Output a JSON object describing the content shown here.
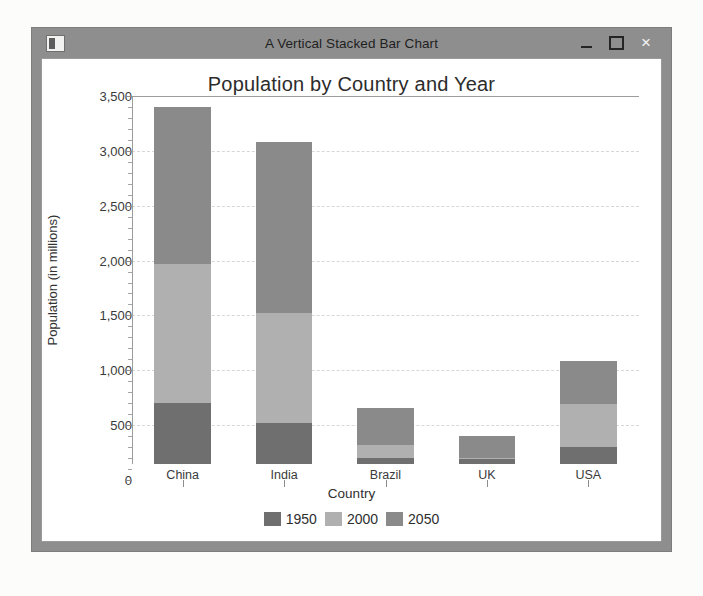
{
  "window": {
    "title": "A Vertical Stacked Bar Chart",
    "icon": "app-window-icon",
    "controls": {
      "minimize": "minimize-button",
      "maximize": "maximize-button",
      "close": "×"
    },
    "frame_color": "#8e8e8e",
    "client_color": "#ffffff"
  },
  "chart_data": {
    "type": "bar",
    "stacked": true,
    "orientation": "vertical",
    "title": "Population by Country and Year",
    "xlabel": "Country",
    "ylabel": "Population (in millions)",
    "categories": [
      "China",
      "India",
      "Brazil",
      "UK",
      "USA"
    ],
    "series": [
      {
        "name": "1950",
        "color": "#6f6f6f",
        "values": [
          554,
          376,
          53,
          50,
          158
        ]
      },
      {
        "name": "2000",
        "color": "#b0b0b0",
        "values": [
          1270,
          1005,
          122,
          9,
          392
        ]
      },
      {
        "name": "2050",
        "color": "#8a8a8a",
        "values": [
          1426,
          1554,
          333,
          193,
          390
        ]
      }
    ],
    "totals": [
      3250,
      2935,
      508,
      252,
      940
    ],
    "ylim": [
      0,
      3500
    ],
    "yticks": [
      0,
      500,
      1000,
      1500,
      2000,
      2500,
      3000,
      3500
    ],
    "ytick_labels": [
      "0",
      "500",
      "1,000",
      "1,500",
      "2,000",
      "2,500",
      "3,000",
      "3,500"
    ],
    "ytick_minor_step": 100,
    "grid": true,
    "grid_style": "dashed",
    "grid_color": "#d7d7d7",
    "legend_position": "bottom",
    "legend_entries": [
      "1950",
      "2000",
      "2050"
    ]
  }
}
